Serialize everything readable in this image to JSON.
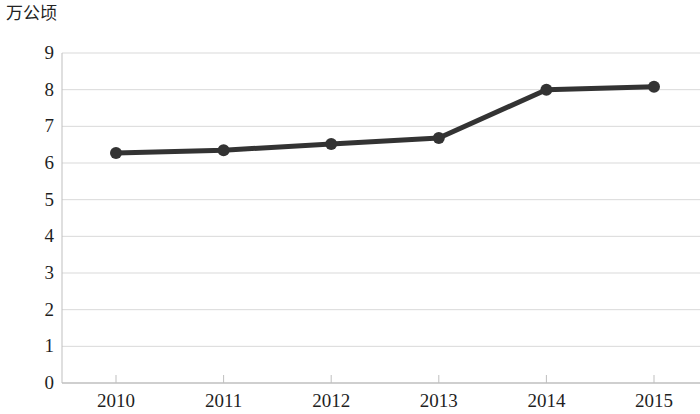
{
  "chart_data": {
    "type": "line",
    "title": "",
    "subtitle": "",
    "xlabel": "",
    "ylabel": "万公顷",
    "unit_label": "万公顷",
    "categories": [
      "2010",
      "2011",
      "2012",
      "2013",
      "2014",
      "2015"
    ],
    "x": [
      2010,
      2011,
      2012,
      2013,
      2014,
      2015
    ],
    "values": [
      6.27,
      6.35,
      6.52,
      6.68,
      8.0,
      8.08
    ],
    "series": [
      {
        "name": "",
        "values": [
          6.27,
          6.35,
          6.52,
          6.68,
          8.0,
          8.08
        ],
        "color": "#333333",
        "marker": "circle",
        "marker_size": 9,
        "line_width": 5
      }
    ],
    "ylim": [
      0,
      9
    ],
    "yticks": [
      0,
      1,
      2,
      3,
      4,
      5,
      6,
      7,
      8,
      9
    ],
    "ytick_labels": [
      "0",
      "1",
      "2",
      "3",
      "4",
      "5",
      "6",
      "7",
      "8",
      "9"
    ],
    "xtick_labels": [
      "2010",
      "2011",
      "2012",
      "2013",
      "2014",
      "2015"
    ],
    "grid": true,
    "grid_axis": "y",
    "grid_color": "#d9d9d9",
    "axis_color": "#bfbfbf",
    "legend": false,
    "legend_position": "none",
    "background": "#ffffff",
    "annotations": []
  }
}
